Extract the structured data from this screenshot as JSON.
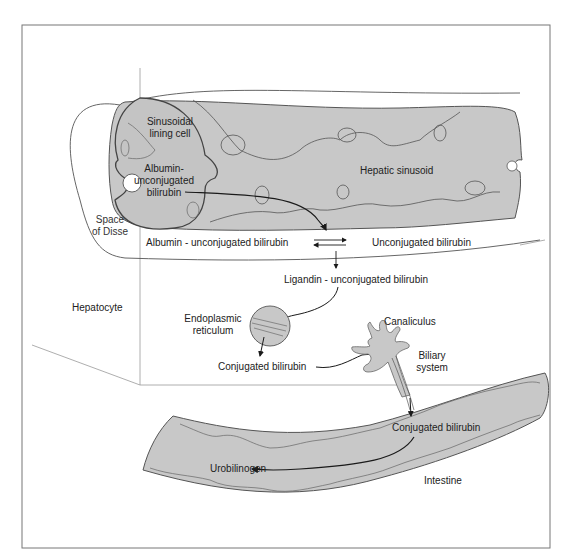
{
  "figure": {
    "colors": {
      "tissue_fill": "#c8c8c8",
      "outline": "#555555",
      "arrow": "#1a1a1a",
      "frame": "#777777",
      "background": "#ffffff"
    }
  },
  "labels": {
    "sinusoidal_lining_cell": [
      "Sinusoidal",
      "lining cell"
    ],
    "albumin_unconjugated_in_cell": [
      "Albumin-",
      "unconjugated",
      "bilirubin"
    ],
    "hepatic_sinusoid": "Hepatic sinusoid",
    "space_of_disse": [
      "Space",
      "of Disse"
    ],
    "albumin_unconjugated": "Albumin - unconjugated bilirubin",
    "unconjugated_bilirubin": "Unconjugated bilirubin",
    "ligandin_unconjugated": "Ligandin - unconjugated bilirubin",
    "hepatocyte": "Hepatocyte",
    "endoplasmic_reticulum": [
      "Endoplasmic",
      "reticulum"
    ],
    "conjugated_bilirubin_er": "Conjugated bilirubin",
    "canaliculus": "Canaliculus",
    "biliary_system": [
      "Biliary",
      "system"
    ],
    "conjugated_bilirubin_intestine": "Conjugated bilirubin",
    "urobilinogen": "Urobilinogen",
    "intestine": "Intestine"
  }
}
